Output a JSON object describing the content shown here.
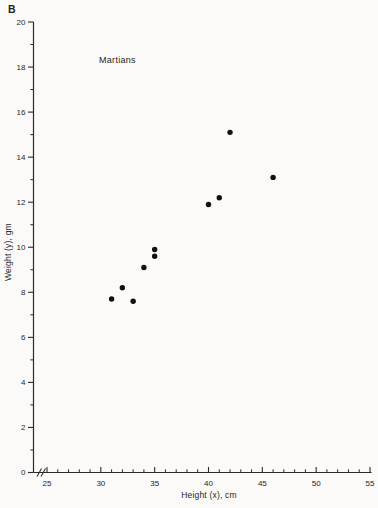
{
  "figure": {
    "panel_label": "B"
  },
  "colors": {
    "ink": "#1f1f1f",
    "axis": "#2b2b2b",
    "point": "#101010",
    "paper": "#fbfaf8"
  },
  "chart_data": {
    "type": "scatter",
    "title": "Martians",
    "annotation": "Martians",
    "xlabel": "Height (x), cm",
    "ylabel": "Weight (y), gm",
    "xlim": [
      25,
      55
    ],
    "ylim": [
      0,
      20
    ],
    "x_tick_labels": [
      "25",
      "30",
      "35",
      "40",
      "45",
      "50",
      "55"
    ],
    "y_tick_labels": [
      "0",
      "2",
      "4",
      "6",
      "8",
      "10",
      "12",
      "14",
      "16",
      "18",
      "20"
    ],
    "x_minor_tick_step": 1,
    "y_minor_tick_step": 1,
    "axis_break_on_x": true,
    "grid": false,
    "legend": false,
    "marker": {
      "shape": "filled-circle",
      "radius_px": 2.7
    },
    "points": [
      {
        "x": 31,
        "y": 7.7
      },
      {
        "x": 32,
        "y": 8.2
      },
      {
        "x": 33,
        "y": 7.6
      },
      {
        "x": 34,
        "y": 9.1
      },
      {
        "x": 35,
        "y": 9.6
      },
      {
        "x": 35,
        "y": 9.9
      },
      {
        "x": 40,
        "y": 11.9
      },
      {
        "x": 41,
        "y": 12.2
      },
      {
        "x": 42,
        "y": 15.1
      },
      {
        "x": 46,
        "y": 13.1
      }
    ]
  }
}
